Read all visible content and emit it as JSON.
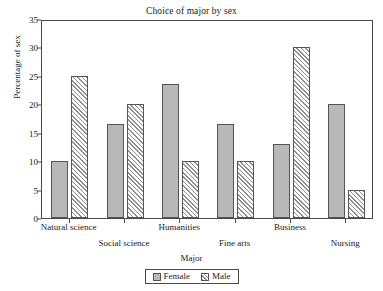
{
  "chart_data": {
    "type": "bar",
    "title": "Choice of major by sex",
    "xlabel": "Major",
    "ylabel": "Percentage of sex",
    "categories": [
      "Natural science",
      "Social science",
      "Humanities",
      "Fine arts",
      "Business",
      "Nursing"
    ],
    "series": [
      {
        "name": "Female",
        "values": [
          10,
          16.5,
          23.5,
          16.5,
          13,
          20
        ],
        "color": "#b8b8b8",
        "pattern": "solid"
      },
      {
        "name": "Male",
        "values": [
          25,
          20,
          10,
          10,
          30,
          5
        ],
        "color": "#ffffff",
        "pattern": "diagonal-hatch"
      }
    ],
    "ylim": [
      0,
      35
    ],
    "yticks": [
      0,
      5,
      10,
      15,
      20,
      25,
      30,
      35
    ],
    "ytick_labels": [
      "0",
      "5",
      "10",
      "15",
      "20",
      "25",
      "30",
      "35"
    ],
    "grid": false,
    "legend_position": "bottom-center",
    "label_stagger": [
      "row-a",
      "row-b",
      "row-a",
      "row-b",
      "row-a",
      "row-b"
    ]
  },
  "legend": {
    "entries": [
      {
        "label": "Female"
      },
      {
        "label": "Male"
      }
    ]
  }
}
